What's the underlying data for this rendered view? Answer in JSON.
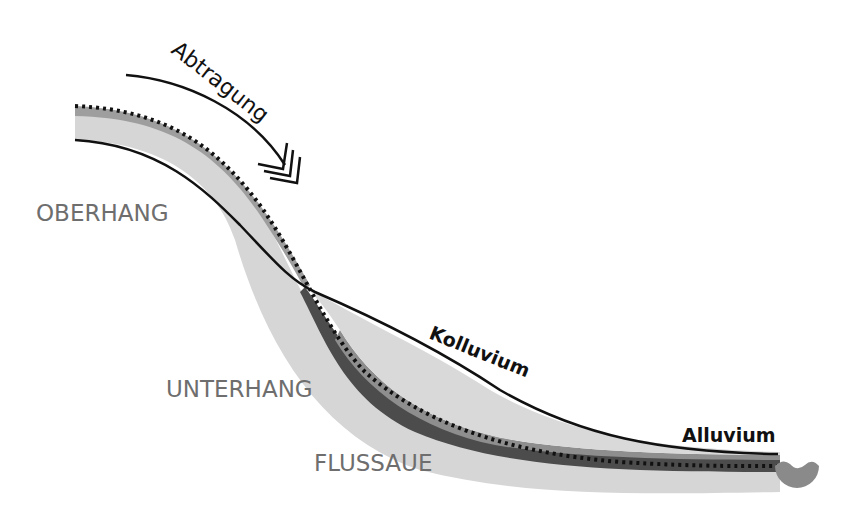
{
  "diagram": {
    "type": "slope-profile",
    "labels": {
      "erosion": "Abtragung",
      "upper_slope": "OBERHANG",
      "lower_slope": "UNTERHANG",
      "floodplain": "FLUSSAUE",
      "colluvium": "Kolluvium",
      "alluvium": "Alluvium"
    },
    "colors": {
      "background": "#ffffff",
      "light_layer": "#d4d4d4",
      "mid_layer": "#9a9a9a",
      "dark_layer": "#4a4a4a",
      "line": "#111111",
      "region_text": "#6e6e6e",
      "water": "#8c8c8c"
    },
    "elements": [
      "erosion-arrow",
      "original-surface-dotted",
      "current-surface-line",
      "colluvium-deposit",
      "alluvium-deposit",
      "river-water"
    ]
  }
}
